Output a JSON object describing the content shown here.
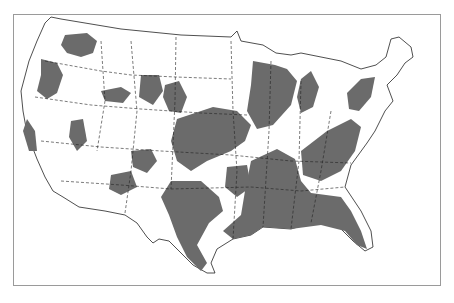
{
  "caption": "",
  "map": {
    "subject": "Contiguous United States",
    "shaded_color": "#6b6b6b",
    "border_color": "#333333",
    "background": "#ffffff",
    "frame_color": "#9a9a9a",
    "state_boundaries": "dashed"
  }
}
